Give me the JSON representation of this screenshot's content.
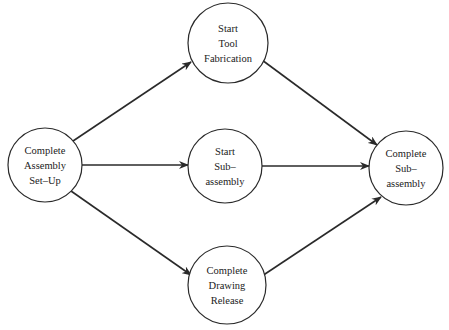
{
  "diagram": {
    "type": "activity-network",
    "colors": {
      "line": "#2a2a2a",
      "background": "#ffffff",
      "text": "#222222"
    },
    "nodes": [
      {
        "id": "n1",
        "name": "complete-assembly-set-up",
        "lines": [
          "Complete",
          "Assembly",
          "Set–Up"
        ],
        "cx": 45,
        "cy": 165,
        "r": 37
      },
      {
        "id": "n2",
        "name": "start-tool-fabrication",
        "lines": [
          "Start",
          "Tool",
          "Fabrication"
        ],
        "cx": 228,
        "cy": 43,
        "r": 40
      },
      {
        "id": "n3",
        "name": "start-sub-assembly",
        "lines": [
          "Start",
          "Sub–",
          "assembly"
        ],
        "cx": 225,
        "cy": 166,
        "r": 37
      },
      {
        "id": "n4",
        "name": "complete-drawing-release",
        "lines": [
          "Complete",
          "Drawing",
          "Release"
        ],
        "cx": 227,
        "cy": 285,
        "r": 39
      },
      {
        "id": "n5",
        "name": "complete-sub-assembly",
        "lines": [
          "Complete",
          "Sub–",
          "assembly"
        ],
        "cx": 406,
        "cy": 168,
        "r": 37
      }
    ],
    "edges": [
      {
        "from": "n1",
        "to": "n2",
        "x1": 73,
        "y1": 141,
        "x2": 191,
        "y2": 62
      },
      {
        "from": "n1",
        "to": "n3",
        "x1": 82,
        "y1": 165,
        "x2": 188,
        "y2": 165
      },
      {
        "from": "n1",
        "to": "n4",
        "x1": 71,
        "y1": 191,
        "x2": 191,
        "y2": 275
      },
      {
        "from": "n2",
        "to": "n5",
        "x1": 262,
        "y1": 60,
        "x2": 377,
        "y2": 145
      },
      {
        "from": "n3",
        "to": "n5",
        "x1": 262,
        "y1": 166,
        "x2": 369,
        "y2": 166
      },
      {
        "from": "n4",
        "to": "n5",
        "x1": 262,
        "y1": 276,
        "x2": 381,
        "y2": 197
      }
    ]
  }
}
